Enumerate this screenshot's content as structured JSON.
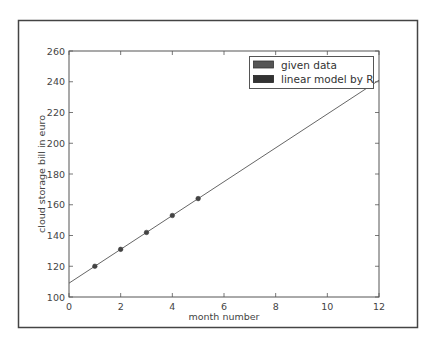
{
  "chart_data": {
    "type": "line",
    "title": "",
    "xlabel": "month number",
    "ylabel": "cloud storage bill in euro",
    "xlim": [
      0,
      12
    ],
    "ylim": [
      100,
      260
    ],
    "xticks": [
      0,
      2,
      4,
      6,
      8,
      10,
      12
    ],
    "yticks": [
      100,
      120,
      140,
      160,
      180,
      200,
      220,
      240,
      260
    ],
    "grid": false,
    "legend_position": "upper right",
    "series": [
      {
        "name": "given data",
        "kind": "scatter",
        "color": "#555555",
        "x": [
          1,
          2,
          3,
          4,
          5
        ],
        "y": [
          120,
          131,
          142,
          153,
          164
        ]
      },
      {
        "name": "linear model by R",
        "kind": "line",
        "color": "#333333",
        "slope": 11,
        "intercept": 109,
        "x": [
          0,
          12
        ],
        "y": [
          109,
          241
        ]
      }
    ]
  },
  "legend": {
    "items": [
      {
        "label": "given data",
        "color": "#555555"
      },
      {
        "label": "linear model by R",
        "color": "#333333"
      }
    ]
  },
  "colors": {
    "frame": "#444444",
    "axes": "#555555",
    "line": "#666666",
    "marker": "#444444"
  }
}
